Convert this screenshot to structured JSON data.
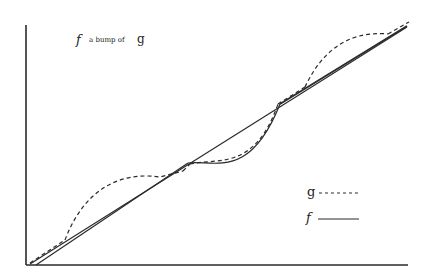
{
  "figure": {
    "title": "f a bump of g",
    "title_parts": {
      "f": "f",
      "middle": "a bump of",
      "g": "g"
    }
  },
  "legend": {
    "items": [
      {
        "label": "g",
        "style": "dashed"
      },
      {
        "label": "f",
        "style": "solid"
      }
    ]
  },
  "colors": {
    "ink": "#2a2a2a",
    "background": "#ffffff"
  }
}
